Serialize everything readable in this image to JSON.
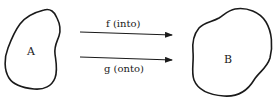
{
  "diagram": {
    "sets": [
      {
        "id": "A",
        "label": "A"
      },
      {
        "id": "B",
        "label": "B"
      }
    ],
    "mappings": [
      {
        "id": "f",
        "label": "f (into)",
        "from": "A",
        "to": "B"
      },
      {
        "id": "g",
        "label": "g (onto)",
        "from": "A",
        "to": "B"
      }
    ],
    "colors": {
      "stroke": "#1a1a1a",
      "background": "#ffffff"
    }
  }
}
